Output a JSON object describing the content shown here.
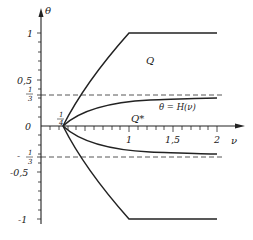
{
  "diagram": {
    "axes": {
      "y_label": "θ",
      "x_label": "ν",
      "y_ticks": [
        {
          "label": "1",
          "value": 1
        },
        {
          "label": "0,5",
          "value": 0.5
        },
        {
          "label_num": "1",
          "label_den": "3",
          "value": 0.3333
        },
        {
          "label": "0",
          "value": 0
        },
        {
          "label_num": "1",
          "label_den": "3",
          "value": -0.3333,
          "sign": "-"
        },
        {
          "label": "-0,5",
          "value": -0.5
        },
        {
          "label": "-1",
          "value": -1
        }
      ],
      "x_ticks": [
        {
          "label": "1",
          "value": 1
        },
        {
          "label": "1,5",
          "value": 1.5
        },
        {
          "label": "2",
          "value": 2
        }
      ],
      "origin_point": {
        "label_num": "1",
        "label_den": "4",
        "value": 0.25
      }
    },
    "labels": {
      "y_tick_1": "1",
      "y_tick_05": "0,5",
      "y_tick_third_num": "1",
      "y_tick_third_den": "3",
      "y_tick_0": "0",
      "y_tick_neg_third_sign": "-",
      "y_tick_neg_third_num": "1",
      "y_tick_neg_third_den": "3",
      "y_tick_neg05": "-0,5",
      "y_tick_neg1": "-1",
      "x_tick_1": "1",
      "x_tick_15": "1,5",
      "x_tick_2": "2",
      "quarter_num": "1",
      "quarter_den": "4",
      "y_axis": "θ",
      "x_axis": "ν",
      "region_q": "Q",
      "region_qstar": "Q*",
      "curve_h": "θ = H(ν)"
    },
    "regions": [
      {
        "name": "Q",
        "description": "region between upper and lower boundary"
      },
      {
        "name": "Q*",
        "description": "region between θ = H(ν) and its mirror"
      }
    ],
    "curves": [
      {
        "name": "upper-boundary",
        "points": [
          [
            0.25,
            0
          ],
          [
            1,
            1
          ],
          [
            2,
            1
          ]
        ]
      },
      {
        "name": "lower-boundary",
        "points": [
          [
            0.25,
            0
          ],
          [
            1,
            -1
          ],
          [
            2,
            -1
          ]
        ]
      },
      {
        "name": "H-curve",
        "label": "θ = H(ν)",
        "asymptote": 0.3333
      },
      {
        "name": "H-curve-mirror",
        "asymptote": -0.3333
      }
    ],
    "dashed_lines": [
      0.3333,
      -0.3333
    ]
  }
}
